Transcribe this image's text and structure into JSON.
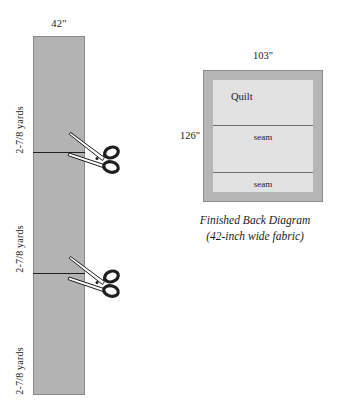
{
  "diagram": {
    "title_hidden": "",
    "fabric_strip": {
      "name": "fabric-yardage-strip",
      "width_label": "42\"",
      "segments": [
        {
          "length_label": "2-7/8 yards"
        },
        {
          "length_label": "2-7/8 yards"
        },
        {
          "length_label": "2-7/8 yards"
        }
      ],
      "cut_marks": [
        {
          "icon": "scissors-icon"
        },
        {
          "icon": "scissors-icon"
        }
      ],
      "fabric_color": "#b3b3b3",
      "cut_line_color": "#1f1f1f"
    },
    "finished_back": {
      "name": "finished-back-diagram",
      "top_dimension": "103\"",
      "left_dimension": "126\"",
      "panels": [
        {
          "label": "Quilt"
        },
        {
          "label": "seam"
        },
        {
          "label": "seam"
        }
      ],
      "caption_line_1": "Finished Back Diagram",
      "caption_line_2": "(42-inch wide fabric)",
      "border_color": "#b6b6b6",
      "inner_color": "#e2e2e2",
      "seam_color": "#6e6e6e"
    }
  }
}
